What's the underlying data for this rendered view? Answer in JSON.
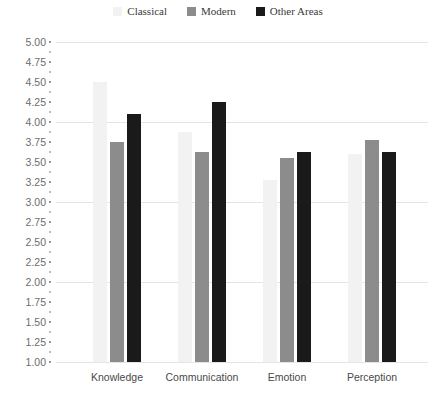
{
  "chart_data": {
    "type": "bar",
    "title": "",
    "xlabel": "",
    "ylabel": "",
    "categories": [
      "Knowledge",
      "Communication",
      "Emotion",
      "Perception"
    ],
    "series": [
      {
        "name": "Classical",
        "color": "#f2f2f2",
        "values": [
          4.5,
          3.88,
          3.28,
          3.6
        ]
      },
      {
        "name": "Modern",
        "color": "#8c8c8c",
        "values": [
          3.75,
          3.62,
          3.55,
          3.78
        ]
      },
      {
        "name": "Other Areas",
        "color": "#1a1a1a",
        "values": [
          4.1,
          4.25,
          3.62,
          3.63
        ]
      }
    ],
    "ylim": [
      1.0,
      5.0
    ],
    "ytick_step": 0.25,
    "ytick_labels": [
      "5.00",
      "4.75",
      "4.50",
      "4.25",
      "4.00",
      "3.75",
      "3.50",
      "3.25",
      "3.00",
      "2.75",
      "2.50",
      "2.25",
      "2.00",
      "1.75",
      "1.50",
      "1.25",
      "1.00"
    ],
    "gridlines_at": [
      5.0,
      4.0,
      3.0,
      2.0,
      1.0
    ],
    "grid": true,
    "legend_position": "top-center"
  },
  "legend": {
    "entries": [
      {
        "label": "Classical"
      },
      {
        "label": "Modern"
      },
      {
        "label": "Other Areas"
      }
    ]
  }
}
